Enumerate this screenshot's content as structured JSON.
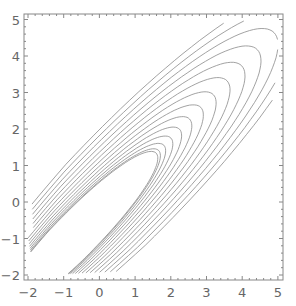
{
  "chart_data": {
    "type": "contour",
    "title": "",
    "xlabel": "",
    "ylabel": "",
    "xlim": [
      -2,
      5
    ],
    "ylim": [
      -2,
      5
    ],
    "x_ticks": [
      "-2",
      "-1",
      "0",
      "1",
      "2",
      "3",
      "4",
      "5"
    ],
    "y_ticks": [
      "-2",
      "-1",
      "0",
      "1",
      "2",
      "3",
      "4",
      "5"
    ],
    "grid": false,
    "contour_levels": 14,
    "line_color": "#8a8a8a",
    "frame_color": "#888888"
  }
}
